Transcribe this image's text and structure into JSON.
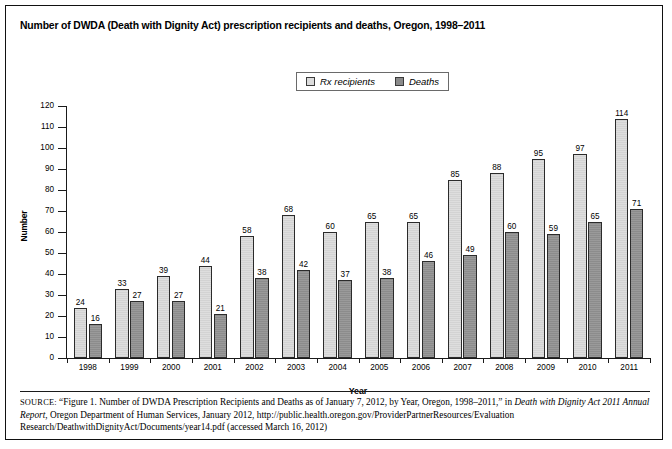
{
  "figure": {
    "title": "Number of DWDA (Death with Dignity Act) prescription recipients and deaths, Oregon, 1998–2011",
    "source_prefix": "SOURCE:",
    "source_part1": " “Figure 1. Number of DWDA Prescription Recipients and Deaths as of January 7, 2012, by Year, Oregon, 1998–2011,” in ",
    "source_italic1": "Death with Dignity Act 2011 Annual Report",
    "source_part2": ", Oregon Department of Human Services, January 2012, http://public.health.oregon.gov/ProviderPartnerResources/Evaluation Research/DeathwithDignityAct/Documents/year14.pdf (accessed March 16, 2012)"
  },
  "legend": {
    "items": [
      {
        "label": "Rx recipients",
        "swatch": "light-gray-swatch-icon",
        "color": "#dedede"
      },
      {
        "label": "Deaths",
        "swatch": "dark-gray-swatch-icon",
        "color": "#8c8c8c"
      }
    ]
  },
  "chart_data": {
    "type": "bar",
    "title": "Number of DWDA (Death with Dignity Act) prescription recipients and deaths, Oregon, 1998–2011",
    "xlabel": "Year",
    "ylabel": "Number",
    "ylim": [
      0,
      120
    ],
    "ytick_step": 10,
    "yticks": [
      0,
      10,
      20,
      30,
      40,
      50,
      60,
      70,
      80,
      90,
      100,
      110,
      120
    ],
    "grid": false,
    "legend_position": "top-center",
    "categories": [
      "1998",
      "1999",
      "2000",
      "2001",
      "2002",
      "2003",
      "2004",
      "2005",
      "2006",
      "2007",
      "2008",
      "2009",
      "2010",
      "2011"
    ],
    "series": [
      {
        "name": "Rx recipients",
        "color": "#dedede",
        "values": [
          24,
          33,
          39,
          44,
          58,
          68,
          60,
          65,
          65,
          85,
          88,
          95,
          97,
          114
        ]
      },
      {
        "name": "Deaths",
        "color": "#8c8c8c",
        "values": [
          16,
          27,
          27,
          21,
          38,
          42,
          37,
          38,
          46,
          49,
          60,
          59,
          65,
          71
        ]
      }
    ]
  }
}
